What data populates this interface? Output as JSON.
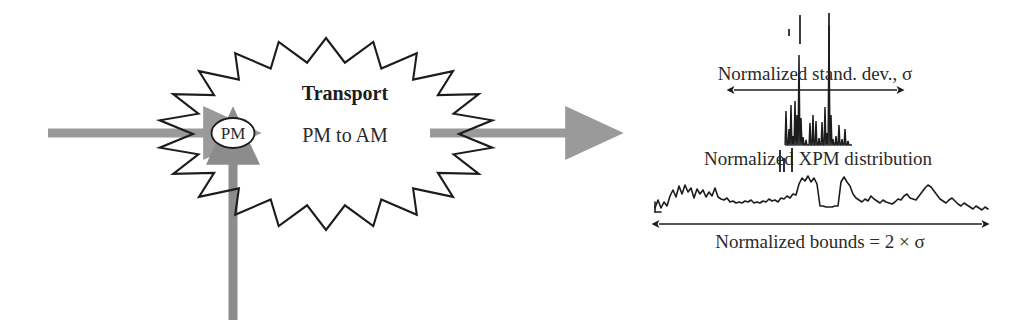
{
  "figure": {
    "title": "",
    "background_color": "#ffffff",
    "ink_color": "#1c1c1c",
    "arrow_gray": "#9a9a9a"
  },
  "left_panel": {
    "name": "transport-block-diagram",
    "burst_label_primary": "Transport",
    "burst_label_secondary": "PM to AM",
    "node_label": "PM",
    "arrows": [
      {
        "id": "input-arrow",
        "direction": "right",
        "color": "#9a9a9a",
        "x1": 48,
        "y1": 133,
        "x2": 218,
        "y2": 133
      },
      {
        "id": "pump-arrow",
        "direction": "up",
        "color": "#8c8c8c",
        "x1": 233,
        "y1": 320,
        "x2": 233,
        "y2": 150
      },
      {
        "id": "output-arrow",
        "direction": "right",
        "color": "#9a9a9a",
        "x1": 430,
        "y1": 133,
        "x2": 580,
        "y2": 133
      }
    ],
    "burst": {
      "cx": 326,
      "cy": 134,
      "rx_outer": 168,
      "ry_outer": 96,
      "rx_inner": 133,
      "ry_inner": 72,
      "points": 22
    },
    "node_ellipse": {
      "cx": 233,
      "cy": 133,
      "rx": 21,
      "ry": 15
    }
  },
  "right_panel": {
    "name": "xpm-distribution-plot",
    "labels": {
      "sigma_label": "Normalized stand. dev., σ",
      "distribution_label": "Normalized XPM distribution",
      "bounds_label": "Normalized bounds = 2 × σ"
    },
    "sigma_arrow": {
      "x1": 730,
      "x2": 901,
      "y": 90
    },
    "bounds_arrow": {
      "x1": 655,
      "x2": 986,
      "y": 224
    },
    "chart_data": {
      "type": "line",
      "title": "",
      "xlabel": "",
      "ylabel": "",
      "grid": false,
      "legend": "none",
      "series": [
        {
          "name": "Normalized stand. dev., σ",
          "note": "narrow spike cluster centred on the sigma arrow; baseline y = 145, values are pixel heights above baseline",
          "baseline_y": 145,
          "x_start": 785,
          "x_end": 852,
          "x_step": 1,
          "values": [
            0,
            0,
            0,
            2,
            2,
            2,
            2,
            0,
            0,
            0,
            0,
            0,
            0,
            0,
            0,
            0,
            0,
            0,
            0,
            0,
            0,
            0,
            0,
            0,
            0,
            0,
            0,
            0,
            0,
            0,
            0,
            0,
            0,
            0,
            0,
            0,
            0,
            0,
            0,
            0,
            0,
            0,
            0,
            0,
            0,
            0,
            0,
            0,
            0,
            0,
            0,
            0,
            0,
            0,
            0,
            0,
            0,
            0,
            0,
            0,
            0,
            0,
            0,
            0,
            0,
            0,
            0
          ],
          "spikes": [
            {
              "x": 786,
              "height": 34
            },
            {
              "x": 789,
              "height": 16
            },
            {
              "x": 791,
              "height": 40
            },
            {
              "x": 793,
              "height": 9
            },
            {
              "x": 795,
              "height": 44
            },
            {
              "x": 797,
              "height": 30
            },
            {
              "x": 799,
              "height": 90
            },
            {
              "x": 801,
              "height": 27
            },
            {
              "x": 803,
              "height": 8
            },
            {
              "x": 806,
              "height": 5
            },
            {
              "x": 810,
              "height": 22
            },
            {
              "x": 813,
              "height": 30
            },
            {
              "x": 816,
              "height": 24
            },
            {
              "x": 819,
              "height": 7
            },
            {
              "x": 822,
              "height": 23
            },
            {
              "x": 825,
              "height": 38
            },
            {
              "x": 827,
              "height": 12
            },
            {
              "x": 829,
              "height": 120
            },
            {
              "x": 831,
              "height": 30
            },
            {
              "x": 833,
              "height": 6
            },
            {
              "x": 836,
              "height": 9
            },
            {
              "x": 839,
              "height": 20
            },
            {
              "x": 842,
              "height": 6
            },
            {
              "x": 845,
              "height": 16
            },
            {
              "x": 848,
              "height": 4
            }
          ],
          "isolated_ticks": [
            {
              "x": 789,
              "y_top": 29,
              "y_bottom": 36
            },
            {
              "x": 800,
              "y_top": 15,
              "y_bottom": 44
            },
            {
              "x": 829,
              "y_top": 13,
              "y_bottom": 52
            }
          ]
        },
        {
          "name": "Normalized XPM distribution",
          "note": "broad noisy distribution; baseline y = 212, values are pixel heights above baseline sampled every 3 px from x = 655 to x = 985",
          "baseline_y": 212,
          "x_start": 655,
          "x_step": 3,
          "values": [
            4,
            12,
            4,
            10,
            6,
            16,
            22,
            15,
            26,
            18,
            27,
            20,
            24,
            14,
            23,
            18,
            22,
            15,
            20,
            16,
            24,
            15,
            13,
            12,
            14,
            10,
            11,
            9,
            10,
            9,
            11,
            10,
            12,
            9,
            10,
            9,
            11,
            10,
            13,
            11,
            12,
            10,
            14,
            13,
            16,
            14,
            18,
            17,
            28,
            34,
            31,
            36,
            30,
            34,
            28,
            6,
            6,
            5,
            5,
            5,
            6,
            6,
            30,
            35,
            30,
            26,
            18,
            14,
            12,
            10,
            13,
            11,
            16,
            13,
            11,
            9,
            12,
            10,
            9,
            8,
            10,
            13,
            12,
            16,
            18,
            14,
            13,
            12,
            16,
            20,
            24,
            27,
            25,
            21,
            17,
            13,
            11,
            9,
            12,
            14,
            11,
            8,
            6,
            9,
            7,
            5,
            3,
            6,
            4,
            2,
            5,
            3
          ],
          "center_gap_ticks": [
            {
              "x": 780,
              "height": 22
            },
            {
              "x": 784,
              "height": 14
            },
            {
              "x": 792,
              "height": 24
            }
          ]
        }
      ]
    }
  }
}
